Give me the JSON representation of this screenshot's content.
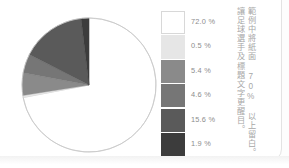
{
  "page": {
    "background_color": "#fdfdfd",
    "edge_color": "#e3e3e3"
  },
  "annotation": {
    "line1": "範例中將紙面 70% 以上留白。",
    "line2": "讓足球選手及標題文字更醒目。"
  },
  "legend": {
    "items": [
      {
        "label": "72.0 %",
        "color": "#ffffff"
      },
      {
        "label": "0.5 %",
        "color": "#e6e6e6"
      },
      {
        "label": "5.4 %",
        "color": "#8a8a8a"
      },
      {
        "label": "4.6 %",
        "color": "#767676"
      },
      {
        "label": "15.6 %",
        "color": "#5a5a5a"
      },
      {
        "label": "1.9 %",
        "color": "#3c3c3c"
      }
    ]
  },
  "chart_data": {
    "type": "pie",
    "title": "",
    "labels": [
      "72.0 %",
      "0.5 %",
      "5.4 %",
      "4.6 %",
      "15.6 %",
      "1.9 %"
    ],
    "values": [
      72.0,
      0.5,
      5.4,
      4.6,
      15.6,
      1.9
    ],
    "unit": "%",
    "colors": [
      "#ffffff",
      "#e6e6e6",
      "#8a8a8a",
      "#767676",
      "#5a5a5a",
      "#3c3c3c"
    ],
    "start_angle_deg": 0,
    "direction": "clockwise",
    "stroke_color": "#c9c9c9",
    "legend_position": "right",
    "annotation": "範例中將紙面 70% 以上留白。讓足球選手及標題文字更醒目。"
  }
}
